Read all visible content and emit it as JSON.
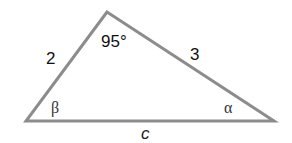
{
  "diagram": {
    "type": "triangle",
    "stroke_color": "#8c8c8c",
    "vertices": {
      "apex": {
        "x": 107,
        "y": 12
      },
      "bottom_left": {
        "x": 26,
        "y": 121
      },
      "bottom_right": {
        "x": 274,
        "y": 121
      }
    },
    "labels": {
      "apex_angle": "95°",
      "left_side": "2",
      "right_side": "3",
      "bottom_side": "c",
      "left_angle": "β",
      "right_angle": "α"
    }
  }
}
